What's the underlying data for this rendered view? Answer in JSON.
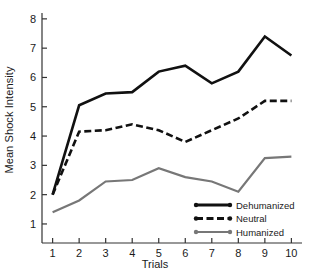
{
  "chart_data": {
    "type": "line",
    "title": "",
    "xlabel": "Trials",
    "ylabel": "Mean Shock Intensity",
    "x": [
      1,
      2,
      3,
      4,
      5,
      6,
      7,
      8,
      9,
      10
    ],
    "xticklabels": [
      "1",
      "2",
      "3",
      "4",
      "5",
      "6",
      "7",
      "8",
      "9",
      "10"
    ],
    "yticklabels": [
      "1",
      "2",
      "3",
      "4",
      "5",
      "6",
      "7",
      "8"
    ],
    "xlim": [
      0.6,
      10.4
    ],
    "ylim": [
      0.35,
      8.2
    ],
    "grid": false,
    "legend_position": "lower-right-inside",
    "series": [
      {
        "name": "Dehumanized",
        "color": "#111111",
        "style": "solid",
        "values": [
          2.0,
          5.05,
          5.45,
          5.5,
          6.2,
          6.4,
          5.8,
          6.2,
          7.4,
          6.75
        ]
      },
      {
        "name": "Neutral",
        "color": "#111111",
        "style": "dashed",
        "values": [
          2.0,
          4.15,
          4.2,
          4.4,
          4.2,
          3.8,
          4.2,
          4.6,
          5.2,
          5.2
        ]
      },
      {
        "name": "Humanized",
        "color": "#777777",
        "style": "solid",
        "values": [
          1.4,
          1.8,
          2.45,
          2.5,
          2.9,
          2.6,
          2.45,
          2.1,
          3.25,
          3.3
        ]
      }
    ]
  },
  "axes": {
    "ylabel": "Mean Shock Intensity",
    "xlabel": "Trials"
  },
  "legend": {
    "items": [
      {
        "label": "Dehumanized"
      },
      {
        "label": "Neutral"
      },
      {
        "label": "Humanized"
      }
    ]
  },
  "colors": {
    "dehumanized": "#111111",
    "neutral": "#111111",
    "humanized": "#777777",
    "axis": "#333333",
    "background": "#ffffff"
  }
}
